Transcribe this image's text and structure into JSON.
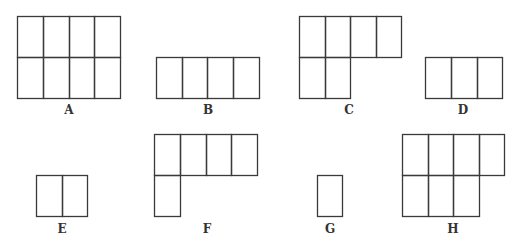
{
  "diagram": {
    "stroke_color": "#3a3a3a",
    "background": "#ffffff",
    "shapes": [
      {
        "label": "A",
        "label_pos": [
          69,
          104
        ],
        "cells": [
          [
            17,
            16,
            26,
            41
          ],
          [
            43,
            16,
            26,
            41
          ],
          [
            69,
            16,
            25,
            41
          ],
          [
            94,
            16,
            26,
            41
          ],
          [
            17,
            57,
            26,
            41
          ],
          [
            43,
            57,
            26,
            41
          ],
          [
            69,
            57,
            25,
            41
          ],
          [
            94,
            57,
            26,
            41
          ]
        ]
      },
      {
        "label": "B",
        "label_pos": [
          208,
          104
        ],
        "cells": [
          [
            156,
            57,
            26,
            41
          ],
          [
            182,
            57,
            25,
            41
          ],
          [
            207,
            57,
            26,
            41
          ],
          [
            233,
            57,
            26,
            41
          ]
        ]
      },
      {
        "label": "C",
        "label_pos": [
          349,
          104
        ],
        "cells": [
          [
            299,
            16,
            26,
            41
          ],
          [
            325,
            16,
            25,
            41
          ],
          [
            350,
            16,
            26,
            41
          ],
          [
            376,
            16,
            25,
            41
          ],
          [
            299,
            57,
            26,
            41
          ],
          [
            325,
            57,
            25,
            41
          ]
        ]
      },
      {
        "label": "D",
        "label_pos": [
          463,
          104
        ],
        "cells": [
          [
            425,
            57,
            26,
            41
          ],
          [
            451,
            57,
            26,
            41
          ],
          [
            477,
            57,
            25,
            41
          ]
        ]
      },
      {
        "label": "E",
        "label_pos": [
          62,
          223
        ],
        "cells": [
          [
            36,
            175,
            26,
            41
          ],
          [
            62,
            175,
            25,
            41
          ]
        ]
      },
      {
        "label": "F",
        "label_pos": [
          207,
          223
        ],
        "cells": [
          [
            154,
            134,
            26,
            41
          ],
          [
            180,
            134,
            26,
            41
          ],
          [
            206,
            134,
            25,
            41
          ],
          [
            231,
            134,
            26,
            41
          ],
          [
            154,
            175,
            26,
            41
          ]
        ]
      },
      {
        "label": "G",
        "label_pos": [
          330,
          223
        ],
        "cells": [
          [
            317,
            175,
            25,
            41
          ]
        ]
      },
      {
        "label": "H",
        "label_pos": [
          453,
          223
        ],
        "cells": [
          [
            402,
            134,
            26,
            41
          ],
          [
            428,
            134,
            25,
            41
          ],
          [
            453,
            134,
            26,
            41
          ],
          [
            479,
            134,
            25,
            41
          ],
          [
            402,
            175,
            26,
            41
          ],
          [
            428,
            175,
            25,
            41
          ],
          [
            453,
            175,
            26,
            41
          ]
        ]
      }
    ]
  }
}
